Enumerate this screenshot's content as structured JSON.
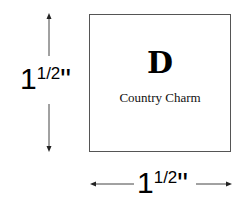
{
  "box": {
    "letter": "D",
    "name": "Country Charm"
  },
  "dimensions": {
    "height": {
      "whole": "1",
      "fraction": "1/2",
      "unit": "\""
    },
    "width": {
      "whole": "1",
      "fraction": "1/2",
      "unit": "\""
    }
  }
}
